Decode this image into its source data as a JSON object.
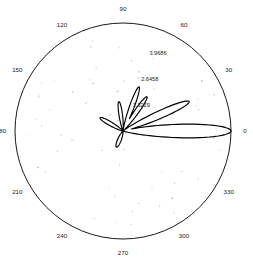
{
  "chart_data": {
    "type": "line",
    "subtype": "polar-radiation-pattern",
    "title": "",
    "xlabel": "",
    "ylabel": "",
    "grid": true,
    "legend": null,
    "angular_axis": {
      "unit": "degrees",
      "direction": "counterclockwise",
      "zero_at": "east",
      "tick_step": 30,
      "tick_labels": [
        "0",
        "30",
        "60",
        "90",
        "120",
        "150",
        "180",
        "210",
        "240",
        "270",
        "300",
        "330"
      ]
    },
    "radial_axis": {
      "rlim": [
        0,
        5.2915
      ],
      "tick_values": [
        1.3229,
        2.6458,
        3.9686
      ],
      "tick_labels": [
        "1.3229",
        "2.6458",
        "3.9686"
      ],
      "tick_label_angle_deg": 72,
      "outer_circle_value": 5.2915
    },
    "series": [
      {
        "name": "pattern",
        "description": "Array factor magnitude versus azimuth angle",
        "lobes": [
          {
            "center_deg": 0,
            "peak_radius": 5.2915,
            "half_width_deg": 9.5,
            "label": "main-lobe"
          },
          {
            "center_deg": 24,
            "peak_radius": 3.55,
            "half_width_deg": 8.0,
            "label": "side-lobe-1"
          },
          {
            "center_deg": 55,
            "peak_radius": 2.05,
            "half_width_deg": 8.0,
            "label": "side-lobe-2"
          },
          {
            "center_deg": 70,
            "peak_radius": 2.3,
            "half_width_deg": 7.5,
            "label": "side-lobe-3"
          },
          {
            "center_deg": 98,
            "peak_radius": 1.45,
            "half_width_deg": 9.0,
            "label": "side-lobe-4"
          },
          {
            "center_deg": 150,
            "peak_radius": 1.3,
            "half_width_deg": 11.0,
            "label": "side-lobe-5"
          },
          {
            "center_deg": 248,
            "peak_radius": 0.85,
            "half_width_deg": 16.0,
            "label": "side-lobe-6"
          }
        ]
      }
    ]
  },
  "plot": {
    "center_x": 123,
    "center_y": 131,
    "outer_radius": 108,
    "background_color": "#ffffff",
    "line_color": "#000000",
    "text_color": "#1a1a1a"
  },
  "angle_labels": [
    {
      "text": "0",
      "deg": 0
    },
    {
      "text": "30",
      "deg": 30
    },
    {
      "text": "60",
      "deg": 60
    },
    {
      "text": "90",
      "deg": 90
    },
    {
      "text": "120",
      "deg": 120
    },
    {
      "text": "150",
      "deg": 150
    },
    {
      "text": "180",
      "deg": 180
    },
    {
      "text": "210",
      "deg": 210
    },
    {
      "text": "240",
      "deg": 240
    },
    {
      "text": "270",
      "deg": 270
    },
    {
      "text": "300",
      "deg": 300
    },
    {
      "text": "330",
      "deg": 330
    }
  ],
  "radial_labels": [
    {
      "text": "1.3229",
      "value": 1.3229
    },
    {
      "text": "2.6458",
      "value": 2.6458
    },
    {
      "text": "3.9686",
      "value": 3.9686
    }
  ]
}
